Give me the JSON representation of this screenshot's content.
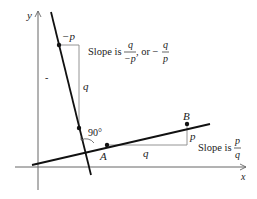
{
  "diagram": {
    "type": "perpendicular-lines-slopes",
    "axes": {
      "x_label": "x",
      "y_label": "y"
    },
    "steep_line": {
      "run_label": "−p",
      "rise_label": "q",
      "slope_text": "Slope is",
      "slope_frac1": {
        "num": "q",
        "den": "−p"
      },
      "slope_or": ", or −",
      "slope_frac2": {
        "num": "q",
        "den": "p"
      }
    },
    "shallow_line": {
      "point_a": "A",
      "point_b": "B",
      "run_label": "q",
      "rise_label": "p",
      "slope_text": "Slope is",
      "slope_frac": {
        "num": "p",
        "den": "q"
      }
    },
    "angle_label": "90°",
    "tick_mark": "-"
  },
  "colors": {
    "line": "#111111",
    "axis": "#666666",
    "guide": "#888888",
    "text": "#222222"
  }
}
